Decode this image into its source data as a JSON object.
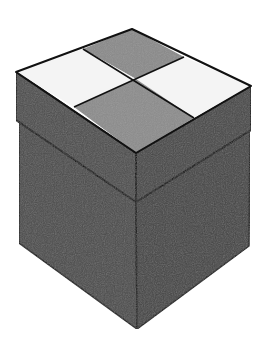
{
  "image": {
    "subject": "gift-box",
    "description": "Isometric box with lid; lid top has a 2x2 checkerboard of light and grey squares",
    "colors": {
      "background": "#ffffff",
      "top_light": "#f4f4f4",
      "top_dark": "#8c8c8c",
      "lid_left": "#4e4e4e",
      "lid_right": "#474747",
      "body_left": "#4b4b4b",
      "body_right": "#444444",
      "outline": "#111111"
    }
  }
}
